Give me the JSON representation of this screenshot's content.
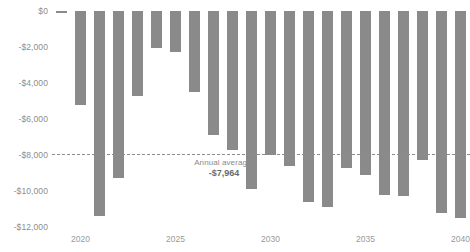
{
  "chart_data": {
    "type": "bar",
    "title": "",
    "subtitle": "",
    "xlabel": "",
    "ylabel": "",
    "grid": false,
    "legend": "none",
    "bar_color": "#8a8a8a",
    "axis_text_color": "#8d8d8d",
    "ylim": [
      -12000,
      0
    ],
    "xlim": [
      2018.5,
      2040.5
    ],
    "categories": [
      2019,
      2020,
      2021,
      2022,
      2023,
      2024,
      2025,
      2026,
      2027,
      2028,
      2029,
      2030,
      2031,
      2032,
      2033,
      2034,
      2035,
      2036,
      2037,
      2038,
      2039,
      2040
    ],
    "values": [
      -120,
      -5200,
      -11400,
      -9300,
      -4700,
      -2050,
      -2300,
      -4500,
      -6900,
      -7700,
      -9900,
      -8000,
      -8600,
      -10600,
      -10900,
      -8700,
      -9100,
      -10200,
      -10300,
      -8300,
      -11200,
      -11500
    ],
    "ytick_labels": [
      "$0",
      "-$2,000",
      "-$4,000",
      "-$6,000",
      "-$8,000",
      "-$10,000",
      "-$12,000"
    ],
    "ytick_values": [
      0,
      -2000,
      -4000,
      -6000,
      -8000,
      -10000,
      -12000
    ],
    "xtick_labels": [
      "2020",
      "2025",
      "2030",
      "2035",
      "2040"
    ],
    "xtick_values": [
      2020,
      2025,
      2030,
      2035,
      2040
    ],
    "annotations": [
      {
        "name": "annual-average",
        "label": "Annual average:",
        "value_text": "-$7,964",
        "value": -7964,
        "style": "dashed-line"
      }
    ]
  }
}
